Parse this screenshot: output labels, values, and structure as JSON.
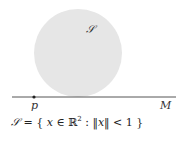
{
  "diagram": {
    "set_label": "𝒮",
    "point_label": "p",
    "line_label": "M",
    "formula": {
      "lhs": "𝒮",
      "eq": " = { ",
      "var": "x",
      "in": " ∈ ℝ",
      "sup": "2",
      "colon": " : ‖",
      "var2": "x",
      "rest": "‖ < 1 }"
    },
    "colors": {
      "disk_fill": "#e6e6e6",
      "line": "#555555",
      "point": "#222222",
      "text": "#222222"
    }
  }
}
